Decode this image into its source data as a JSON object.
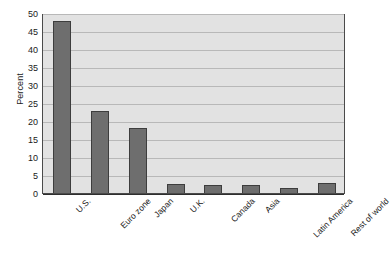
{
  "chart_data": {
    "type": "bar",
    "title": "",
    "subtitle": "",
    "xlabel": "",
    "ylabel": "Percent",
    "ylim": [
      0,
      50
    ],
    "yticks": [
      0,
      5,
      10,
      15,
      20,
      25,
      30,
      35,
      40,
      45,
      50
    ],
    "ytick_labels": [
      "0",
      "5",
      "10",
      "15",
      "20",
      "25",
      "30",
      "35",
      "40",
      "45",
      "50"
    ],
    "grid": true,
    "legend": null,
    "legend_position": "none",
    "categories": [
      "U.S.",
      "Euro zone",
      "Japan",
      "U.K.",
      "Canada",
      "Asia",
      "Latin America",
      "Rest of world"
    ],
    "values": [
      47.8,
      22.8,
      18.1,
      2.4,
      2.2,
      2.3,
      1.5,
      2.8
    ],
    "bar_color": "#6e6e6e",
    "bar_edge_color": "#3d3d3d",
    "plot_background": "#e2e2e2",
    "gridline_color": "#b8b8b8",
    "axis_color": "#2e2e2e",
    "page_background": "#ffffff",
    "xtick_label_rotation": -45
  }
}
